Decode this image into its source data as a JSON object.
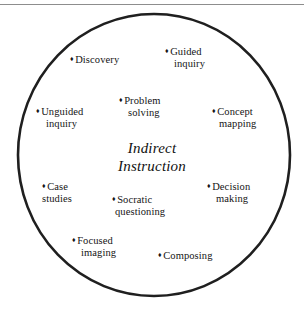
{
  "figure": {
    "type": "circle-cluster-diagram",
    "center_label": {
      "line1": "Indirect",
      "line2": "Instruction"
    },
    "bullet_glyph": "♦",
    "colors": {
      "circle_stroke": "#1f1f1f",
      "text": "#141414",
      "rule": "#8d8d8d",
      "background": "#ffffff"
    },
    "top_rule": true,
    "items": [
      {
        "id": "discovery",
        "line1": "Discovery",
        "line2": ""
      },
      {
        "id": "guided",
        "line1": "Guided",
        "line2": "inquiry"
      },
      {
        "id": "unguided",
        "line1": "Unguided",
        "line2": "inquiry"
      },
      {
        "id": "problem",
        "line1": "Problem",
        "line2": "solving"
      },
      {
        "id": "concept",
        "line1": "Concept",
        "line2": "mapping"
      },
      {
        "id": "case",
        "line1": "Case",
        "line2": "studies"
      },
      {
        "id": "socratic",
        "line1": "Socratic",
        "line2": "questioning"
      },
      {
        "id": "decision",
        "line1": "Decision",
        "line2": "making"
      },
      {
        "id": "focused",
        "line1": "Focused",
        "line2": "imaging"
      },
      {
        "id": "composing",
        "line1": "Composing",
        "line2": ""
      }
    ]
  }
}
